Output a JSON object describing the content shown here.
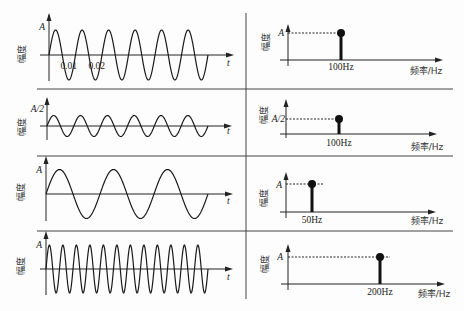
{
  "figure": {
    "y_label": "幅度",
    "time_axis_label": "t",
    "freq_axis_label": "频率/Hz"
  },
  "chart_data": [
    {
      "type": "line",
      "panel": "row1-time",
      "xlabel": "t",
      "ylabel": "幅度",
      "amplitude_label": "A",
      "amplitude": 1,
      "frequency_hz": 100,
      "cycles_shown": 6,
      "x_ticks": [
        "0.01",
        "0.02"
      ],
      "grid": false
    },
    {
      "type": "bar",
      "subtype": "stem",
      "panel": "row1-spectrum",
      "xlabel": "频率/Hz",
      "ylabel": "幅度",
      "categories": [
        "100Hz"
      ],
      "values": [
        1
      ],
      "value_label": "A",
      "grid": false
    },
    {
      "type": "line",
      "panel": "row2-time",
      "xlabel": "t",
      "ylabel": "幅度",
      "amplitude_label": "A/2",
      "amplitude": 0.5,
      "frequency_hz": 100,
      "cycles_shown": 6,
      "grid": false
    },
    {
      "type": "bar",
      "subtype": "stem",
      "panel": "row2-spectrum",
      "xlabel": "频率/Hz",
      "ylabel": "幅度",
      "categories": [
        "100Hz"
      ],
      "values": [
        0.5
      ],
      "value_label": "A/2",
      "grid": false
    },
    {
      "type": "line",
      "panel": "row3-time",
      "xlabel": "t",
      "ylabel": "幅度",
      "amplitude_label": "A",
      "amplitude": 1,
      "frequency_hz": 50,
      "cycles_shown": 3,
      "grid": false
    },
    {
      "type": "bar",
      "subtype": "stem",
      "panel": "row3-spectrum",
      "xlabel": "频率/Hz",
      "ylabel": "幅度",
      "categories": [
        "50Hz"
      ],
      "values": [
        1
      ],
      "value_label": "A",
      "grid": false
    },
    {
      "type": "line",
      "panel": "row4-time",
      "xlabel": "t",
      "ylabel": "幅度",
      "amplitude_label": "A",
      "amplitude": 1,
      "frequency_hz": 200,
      "cycles_shown": 12,
      "grid": false
    },
    {
      "type": "bar",
      "subtype": "stem",
      "panel": "row4-spectrum",
      "xlabel": "频率/Hz",
      "ylabel": "幅度",
      "categories": [
        "200Hz"
      ],
      "values": [
        1
      ],
      "value_label": "A",
      "grid": false
    }
  ]
}
